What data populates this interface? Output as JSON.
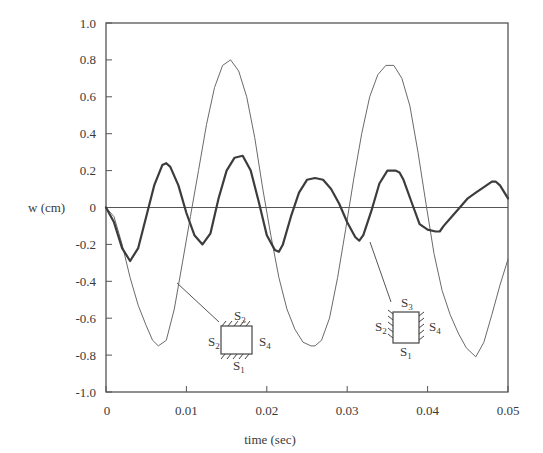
{
  "chart_data": {
    "type": "line",
    "title": "",
    "xlabel": "time (sec)",
    "ylabel": "w (cm)",
    "xlim": [
      0,
      0.05
    ],
    "ylim": [
      -1.0,
      1.0
    ],
    "grid": false,
    "legend": "none (inline inset diagrams with leader lines)",
    "x_ticks": [
      0,
      0.01,
      0.02,
      0.03,
      0.04,
      0.05
    ],
    "x_tick_labels": [
      "0",
      "0.01",
      "0.02",
      "0.03",
      "0.04",
      "0.05"
    ],
    "y_ticks": [
      1.0,
      0.8,
      0.6,
      0.4,
      0.2,
      0,
      -0.2,
      -0.4,
      -0.6,
      -0.8,
      -1.0
    ],
    "y_tick_labels": [
      "1.0",
      "0.8",
      "0.6",
      "0.4",
      "0.2",
      "0",
      "-0.2",
      "-0.4",
      "-0.6",
      "-0.8",
      "-1.0"
    ],
    "series": [
      {
        "name": "S1 and S3 clamped (thin solid)",
        "style": "thin",
        "x": [
          0,
          0.001,
          0.002,
          0.003,
          0.004,
          0.005,
          0.0058,
          0.0065,
          0.0075,
          0.0085,
          0.0095,
          0.0105,
          0.0115,
          0.0125,
          0.0135,
          0.0145,
          0.0155,
          0.0165,
          0.0175,
          0.0185,
          0.0195,
          0.0205,
          0.0215,
          0.0225,
          0.0235,
          0.0245,
          0.0255,
          0.026,
          0.0268,
          0.0278,
          0.0288,
          0.0298,
          0.0308,
          0.0318,
          0.0328,
          0.0338,
          0.0348,
          0.0358,
          0.0368,
          0.0378,
          0.0388,
          0.0398,
          0.0408,
          0.0418,
          0.0428,
          0.0438,
          0.0448,
          0.046,
          0.047,
          0.048,
          0.049,
          0.05
        ],
        "y": [
          0,
          -0.05,
          -0.2,
          -0.38,
          -0.53,
          -0.64,
          -0.72,
          -0.75,
          -0.72,
          -0.55,
          -0.3,
          -0.05,
          0.2,
          0.45,
          0.65,
          0.77,
          0.8,
          0.74,
          0.6,
          0.38,
          0.1,
          -0.15,
          -0.38,
          -0.55,
          -0.66,
          -0.73,
          -0.75,
          -0.75,
          -0.72,
          -0.6,
          -0.38,
          -0.12,
          0.15,
          0.4,
          0.6,
          0.72,
          0.77,
          0.77,
          0.7,
          0.55,
          0.3,
          0.02,
          -0.25,
          -0.45,
          -0.58,
          -0.68,
          -0.76,
          -0.81,
          -0.73,
          -0.58,
          -0.42,
          -0.28
        ]
      },
      {
        "name": "S2 and S4 clamped (thick)",
        "style": "thick",
        "x": [
          0,
          0.001,
          0.002,
          0.003,
          0.004,
          0.005,
          0.006,
          0.007,
          0.0075,
          0.008,
          0.009,
          0.01,
          0.011,
          0.012,
          0.013,
          0.014,
          0.015,
          0.016,
          0.017,
          0.018,
          0.019,
          0.02,
          0.021,
          0.0215,
          0.022,
          0.023,
          0.024,
          0.025,
          0.026,
          0.027,
          0.028,
          0.029,
          0.03,
          0.031,
          0.0315,
          0.032,
          0.033,
          0.034,
          0.035,
          0.036,
          0.0365,
          0.037,
          0.038,
          0.039,
          0.04,
          0.041,
          0.0415,
          0.042,
          0.043,
          0.044,
          0.045,
          0.046,
          0.047,
          0.048,
          0.0485,
          0.049,
          0.05
        ],
        "y": [
          0,
          -0.08,
          -0.22,
          -0.29,
          -0.22,
          -0.05,
          0.12,
          0.23,
          0.24,
          0.22,
          0.12,
          -0.03,
          -0.15,
          -0.2,
          -0.14,
          0.05,
          0.2,
          0.27,
          0.28,
          0.2,
          0.03,
          -0.15,
          -0.23,
          -0.24,
          -0.2,
          -0.05,
          0.08,
          0.15,
          0.16,
          0.15,
          0.1,
          0.02,
          -0.08,
          -0.16,
          -0.18,
          -0.15,
          -0.02,
          0.13,
          0.2,
          0.2,
          0.19,
          0.15,
          0.03,
          -0.09,
          -0.12,
          -0.13,
          -0.13,
          -0.1,
          -0.05,
          0.0,
          0.05,
          0.08,
          0.11,
          0.14,
          0.14,
          0.12,
          0.05
        ]
      }
    ],
    "annotations": [
      {
        "type": "inset-diagram",
        "labels": [
          "S1",
          "S2",
          "S3",
          "S4"
        ],
        "clamped_edges": [
          "S1",
          "S3"
        ],
        "points_to_series": "S1 and S3 clamped (thin solid)",
        "leader_from_xy": [
          0.0085,
          -0.55
        ]
      },
      {
        "type": "inset-diagram",
        "labels": [
          "S1",
          "S2",
          "S3",
          "S4"
        ],
        "clamped_edges": [
          "S2",
          "S4"
        ],
        "points_to_series": "S2 and S4 clamped (thick)",
        "leader_from_xy": [
          0.0317,
          -0.18
        ]
      }
    ]
  },
  "labels": {
    "xlabel": "time (sec)",
    "ylabel": "w (cm)",
    "inset1": {
      "top": "S",
      "top_sub": "3",
      "left": "S",
      "left_sub": "2",
      "right": "S",
      "right_sub": "4",
      "bottom": "S",
      "bottom_sub": "1"
    },
    "inset2": {
      "top": "S",
      "top_sub": "3",
      "left": "S",
      "left_sub": "2",
      "right": "S",
      "right_sub": "4",
      "bottom": "S",
      "bottom_sub": "1"
    }
  },
  "colors": {
    "axis": "#555555",
    "thin_line": "#6a6a6a",
    "thick_line": "#3c3c3c",
    "text": "#3a3a3a"
  }
}
